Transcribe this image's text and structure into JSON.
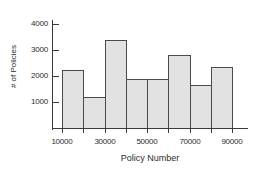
{
  "chart_data": {
    "type": "bar",
    "title": "",
    "subtitle": "",
    "xlabel": "Policy Number",
    "ylabel": "# of Policies",
    "categories": [
      "10000-20000",
      "20000-30000",
      "30000-40000",
      "40000-50000",
      "50000-60000",
      "60000-70000",
      "70000-80000",
      "80000-90000"
    ],
    "bin_edges": [
      10000,
      20000,
      30000,
      40000,
      50000,
      60000,
      70000,
      80000,
      90000
    ],
    "values": [
      2250,
      1200,
      3400,
      1870,
      1900,
      2820,
      1650,
      2340
    ],
    "xlim": [
      10000,
      90000
    ],
    "ylim": [
      0,
      4000
    ],
    "xticks": [
      10000,
      30000,
      50000,
      70000,
      90000
    ],
    "xtick_labels": [
      "10000",
      "30000",
      "50000",
      "70000",
      "90000"
    ],
    "yticks": [
      1000,
      2000,
      3000,
      4000
    ],
    "ytick_labels": [
      "1000",
      "2000",
      "3000",
      "4000"
    ],
    "grid": false,
    "legend": false,
    "legend_position": "none",
    "bar_fill_color": "#e2e2e2",
    "bar_edge_color": "#4a4a4a",
    "axis_color": "#3a3a3a",
    "background_color": "#ffffff"
  }
}
